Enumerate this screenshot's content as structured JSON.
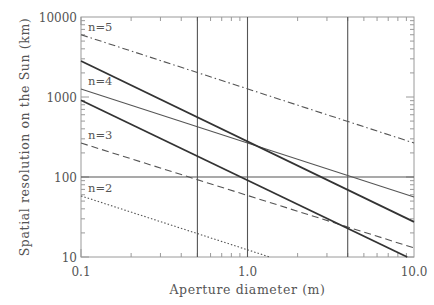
{
  "chart_data": {
    "type": "line",
    "title": "",
    "xlabel": "Aperture diameter (m)",
    "ylabel": "Spatial resolution on the Sun (km)",
    "xscale": "log",
    "yscale": "log",
    "xlim": [
      0.1,
      10.0
    ],
    "ylim": [
      10,
      10000
    ],
    "xticks": [
      0.1,
      1.0,
      10.0
    ],
    "xtick_labels": [
      "0.1",
      "1.0",
      "10.0"
    ],
    "yticks": [
      10,
      100,
      1000,
      10000
    ],
    "ytick_labels": [
      "10",
      "100",
      "1000",
      "10000"
    ],
    "grid": false,
    "legend": "none (inline labels at left edge)",
    "series": [
      {
        "name": "n=5",
        "style": "dash-dot",
        "width": "thin",
        "x": [
          0.1,
          10.0
        ],
        "y": [
          6000,
          266
        ]
      },
      {
        "name": "n=4",
        "style": "solid",
        "width": "thin",
        "x": [
          0.1,
          10.0
        ],
        "y": [
          1260,
          56
        ]
      },
      {
        "name": "n=3",
        "style": "dashed",
        "width": "thin",
        "x": [
          0.1,
          10.0
        ],
        "y": [
          266,
          13
        ]
      },
      {
        "name": "n=2",
        "style": "dotted",
        "width": "thin",
        "x": [
          0.1,
          1.36
        ],
        "y": [
          58,
          10
        ]
      },
      {
        "name": "diffraction-limit-upper",
        "style": "solid",
        "width": "thick",
        "x": [
          0.1,
          10.0
        ],
        "y": [
          2820,
          27.5
        ]
      },
      {
        "name": "diffraction-limit-lower",
        "style": "solid",
        "width": "thick",
        "x": [
          0.1,
          9.1
        ],
        "y": [
          912,
          10
        ]
      }
    ],
    "reference_lines": {
      "vertical_x": [
        0.5,
        1.0,
        4.0
      ],
      "horizontal_y": [
        100
      ]
    },
    "annotations": [
      {
        "text": "n=5",
        "x": 0.1,
        "y": 6000
      },
      {
        "text": "n=4",
        "x": 0.1,
        "y": 1260
      },
      {
        "text": "n=3",
        "x": 0.1,
        "y": 266
      },
      {
        "text": "n=2",
        "x": 0.1,
        "y": 58
      }
    ]
  },
  "labels": {
    "xlabel": "Aperture diameter (m)",
    "ylabel": "Spatial resolution on the Sun (km)",
    "x0": "0.1",
    "x1": "1.0",
    "x2": "10.0",
    "y0": "10",
    "y1": "100",
    "y2": "1000",
    "y3": "10000",
    "n5": "n=5",
    "n4": "n=4",
    "n3": "n=3",
    "n2": "n=2"
  }
}
